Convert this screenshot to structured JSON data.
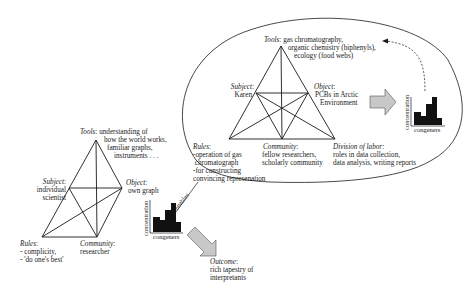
{
  "left_system": {
    "tools": {
      "heading": "Tools",
      "lines": [
        "understanding of",
        "how the world works,",
        "familiar graphs,",
        "instruments . . ."
      ]
    },
    "subject": {
      "heading": "Subject",
      "lines": [
        "individual",
        "scientist"
      ]
    },
    "object": {
      "heading": "Object",
      "lines": [
        "own graph"
      ]
    },
    "rules": {
      "heading": "Rules",
      "lines": [
        "- complicity,",
        "- 'do one's best'"
      ]
    },
    "community": {
      "heading": "Community",
      "lines": [
        "researcher"
      ]
    },
    "mini_chart": {
      "ylabel": "concentration",
      "xlabel": "congeners"
    }
  },
  "right_system": {
    "tools": {
      "heading": "Tools",
      "lines": [
        "gas chromatography,",
        "organic chemistry (biphenyls),",
        "ecology (food webs)"
      ]
    },
    "subject": {
      "heading": "Subject",
      "lines": [
        "Karen"
      ]
    },
    "object": {
      "heading": "Object",
      "lines": [
        "PCBs in Arctic",
        "Environment"
      ]
    },
    "rules": {
      "heading": "Rules",
      "lines": [
        "-operation of gas",
        " chromatograph",
        "-for constructing",
        "convincing represenation"
      ]
    },
    "community": {
      "heading": "Community",
      "lines": [
        "fellow researchers,",
        "scholarly community"
      ]
    },
    "division_of_labor": {
      "heading": "Division  of labor",
      "lines": [
        "roles in data collection,",
        "data analysis, writing reports"
      ]
    },
    "mini_chart": {
      "ylabel": "concentration",
      "xlabel": "congeners"
    }
  },
  "connector": {
    "label": "enables"
  },
  "outcome": {
    "heading": "Outcome",
    "lines": [
      "rich tapestry of",
      "interpretants"
    ]
  },
  "colors": {
    "line": "#1a1a1a",
    "arrow_fill": "#c8c8c8",
    "bars": "#111111"
  }
}
